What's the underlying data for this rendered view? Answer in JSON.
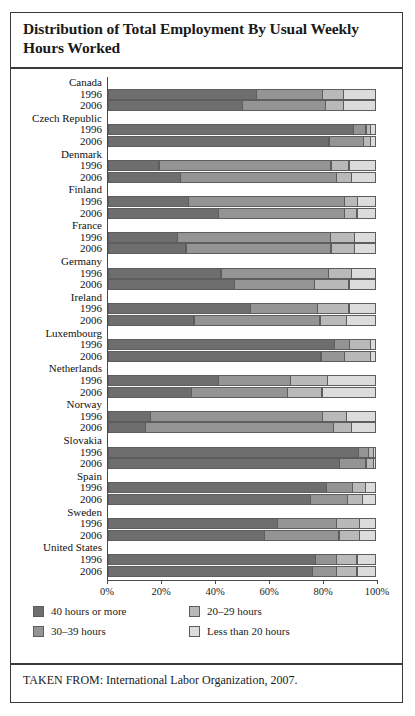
{
  "figure": {
    "title": "Distribution of Total Employment By Usual Weekly Hours Worked",
    "source_note": "TAKEN FROM: International Labor Organization, 2007."
  },
  "chart_data": {
    "type": "bar",
    "orientation": "horizontal",
    "stacked": true,
    "stack_total": 100,
    "title": "Distribution of Total Employment By Usual Weekly Hours Worked",
    "xlabel": "",
    "ylabel": "",
    "xlim": [
      0,
      100
    ],
    "xticks": [
      0,
      20,
      40,
      60,
      80,
      100
    ],
    "xtick_labels": [
      "0%",
      "20%",
      "40%",
      "60%",
      "80%",
      "100%"
    ],
    "grid": false,
    "legend_position": "below-plot",
    "series": [
      {
        "name": "40 hours or more",
        "color": "#6e6e6e"
      },
      {
        "name": "30–39 hours",
        "color": "#949494"
      },
      {
        "name": "20–29 hours",
        "color": "#b9b9b9"
      },
      {
        "name": "Less than 20 hours",
        "color": "#dcdcdc"
      }
    ],
    "categories": [
      "Canada",
      "Czech Republic",
      "Denmark",
      "Finland",
      "France",
      "Germany",
      "Ireland",
      "Luxembourg",
      "Netherlands",
      "Norway",
      "Slovakia",
      "Spain",
      "Sweden",
      "United States"
    ],
    "years": [
      "1996",
      "2006"
    ],
    "groups": [
      {
        "country": "Canada",
        "rows": [
          {
            "year": "1996",
            "values": [
              55,
              25,
              8,
              12
            ]
          },
          {
            "year": "2006",
            "values": [
              50,
              31,
              7,
              12
            ]
          }
        ]
      },
      {
        "country": "Czech Republic",
        "rows": [
          {
            "year": "1996",
            "values": [
              91,
              5,
              2,
              2
            ]
          },
          {
            "year": "2006",
            "values": [
              82,
              13,
              3,
              2
            ]
          }
        ]
      },
      {
        "country": "Denmark",
        "rows": [
          {
            "year": "1996",
            "values": [
              19,
              64,
              7,
              10
            ]
          },
          {
            "year": "2006",
            "values": [
              27,
              58,
              6,
              9
            ]
          }
        ]
      },
      {
        "country": "Finland",
        "rows": [
          {
            "year": "1996",
            "values": [
              30,
              58,
              5,
              7
            ]
          },
          {
            "year": "2006",
            "values": [
              41,
              47,
              5,
              7
            ]
          }
        ]
      },
      {
        "country": "France",
        "rows": [
          {
            "year": "1996",
            "values": [
              26,
              57,
              9,
              8
            ]
          },
          {
            "year": "2006",
            "values": [
              29,
              54,
              9,
              8
            ]
          }
        ]
      },
      {
        "country": "Germany",
        "rows": [
          {
            "year": "1996",
            "values": [
              42,
              40,
              9,
              9
            ]
          },
          {
            "year": "2006",
            "values": [
              47,
              30,
              13,
              10
            ]
          }
        ]
      },
      {
        "country": "Ireland",
        "rows": [
          {
            "year": "1996",
            "values": [
              53,
              25,
              12,
              10
            ]
          },
          {
            "year": "2006",
            "values": [
              32,
              47,
              10,
              11
            ]
          }
        ]
      },
      {
        "country": "Luxembourg",
        "rows": [
          {
            "year": "1996",
            "values": [
              84,
              6,
              8,
              2
            ]
          },
          {
            "year": "2006",
            "values": [
              79,
              9,
              10,
              2
            ]
          }
        ]
      },
      {
        "country": "Netherlands",
        "rows": [
          {
            "year": "1996",
            "values": [
              41,
              27,
              14,
              18
            ]
          },
          {
            "year": "2006",
            "values": [
              31,
              36,
              13,
              20
            ]
          }
        ]
      },
      {
        "country": "Norway",
        "rows": [
          {
            "year": "1996",
            "values": [
              16,
              64,
              9,
              11
            ]
          },
          {
            "year": "2006",
            "values": [
              14,
              70,
              7,
              9
            ]
          }
        ]
      },
      {
        "country": "Slovakia",
        "rows": [
          {
            "year": "1996",
            "values": [
              93,
              4,
              2,
              1
            ]
          },
          {
            "year": "2006",
            "values": [
              86,
              10,
              3,
              1
            ]
          }
        ]
      },
      {
        "country": "Spain",
        "rows": [
          {
            "year": "1996",
            "values": [
              81,
              10,
              5,
              4
            ]
          },
          {
            "year": "2006",
            "values": [
              75,
              14,
              6,
              5
            ]
          }
        ]
      },
      {
        "country": "Sweden",
        "rows": [
          {
            "year": "1996",
            "values": [
              63,
              22,
              9,
              6
            ]
          },
          {
            "year": "2006",
            "values": [
              58,
              28,
              8,
              6
            ]
          }
        ]
      },
      {
        "country": "United States",
        "rows": [
          {
            "year": "1996",
            "values": [
              77,
              8,
              8,
              7
            ]
          },
          {
            "year": "2006",
            "values": [
              76,
              9,
              8,
              7
            ]
          }
        ]
      }
    ]
  },
  "legend": {
    "items": [
      {
        "label": "40 hours or more",
        "color": "#6e6e6e"
      },
      {
        "label": "30–39 hours",
        "color": "#949494"
      },
      {
        "label": "20–29 hours",
        "color": "#b9b9b9"
      },
      {
        "label": "Less than 20 hours",
        "color": "#dcdcdc"
      }
    ]
  }
}
